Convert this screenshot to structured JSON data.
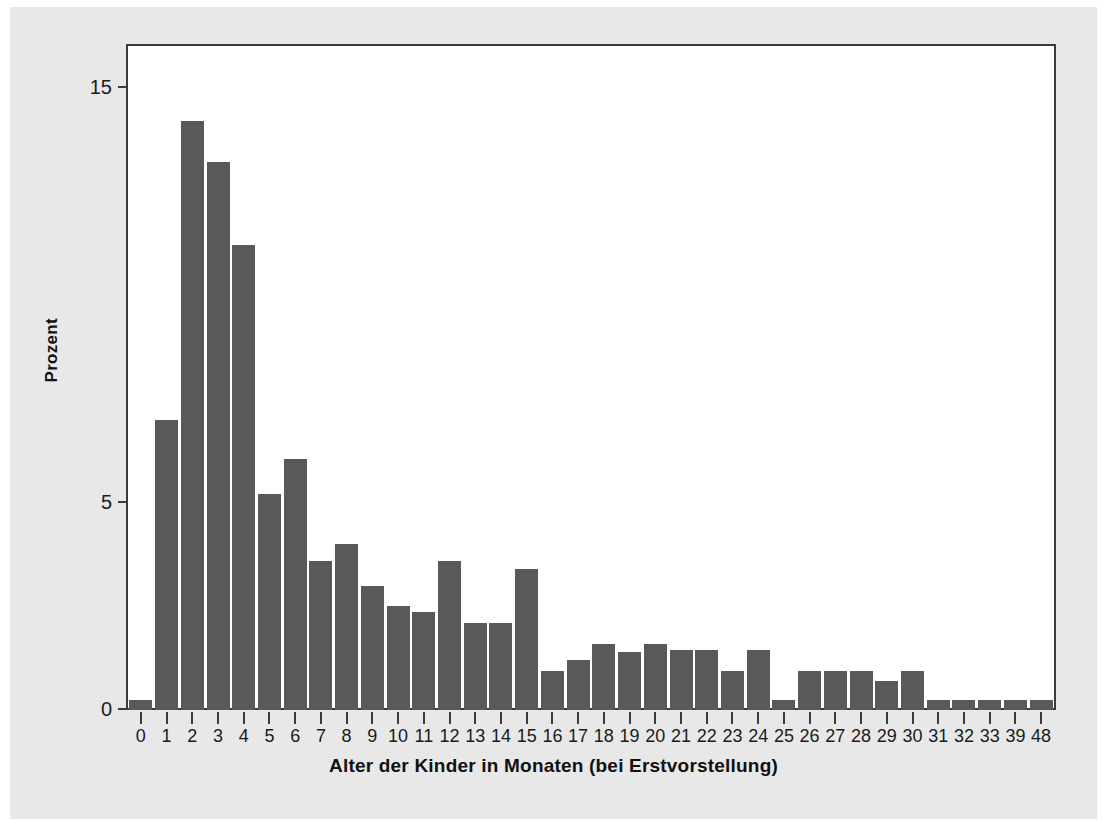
{
  "chart_data": {
    "type": "bar",
    "title": "",
    "subtitle": "",
    "xlabel": "Alter der Kinder in Monaten (bei Erstvorstellung)",
    "ylabel": "Prozent",
    "categories": [
      "0",
      "1",
      "2",
      "3",
      "4",
      "5",
      "6",
      "7",
      "8",
      "9",
      "10",
      "11",
      "12",
      "13",
      "14",
      "15",
      "16",
      "17",
      "18",
      "19",
      "20",
      "21",
      "22",
      "23",
      "24",
      "25",
      "26",
      "27",
      "28",
      "29",
      "30",
      "31",
      "32",
      "33",
      "39",
      "48"
    ],
    "values": [
      0.25,
      7.0,
      14.2,
      13.2,
      11.2,
      5.2,
      6.05,
      3.6,
      4.0,
      3.0,
      2.5,
      2.35,
      3.6,
      2.1,
      2.1,
      3.4,
      0.95,
      1.2,
      1.6,
      1.4,
      1.6,
      1.45,
      1.45,
      0.95,
      1.45,
      0.25,
      0.95,
      0.95,
      0.95,
      0.7,
      0.95,
      0.25,
      0.25,
      0.25,
      0.25,
      0.25
    ],
    "ylim": [
      0,
      16
    ],
    "yticks": [
      0,
      5,
      15
    ],
    "ytick_labels": [
      "0",
      "5",
      "15"
    ],
    "grid": false,
    "legend": null,
    "bar_color": "#595959",
    "plot_background": "#ffffff",
    "page_background": "#e8e8e8",
    "axis_color": "#3b3b3b"
  }
}
